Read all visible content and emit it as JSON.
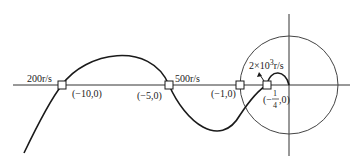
{
  "diagram": {
    "type": "nyquist-plot",
    "frequency_labels": [
      {
        "id": "w1",
        "text": "200r/s"
      },
      {
        "id": "w2",
        "text": "500r/s"
      },
      {
        "id": "w3",
        "text": "2×10",
        "sup": "3",
        "suffix": "r/s"
      }
    ],
    "points": [
      {
        "id": "p1",
        "text": "(−10,0)"
      },
      {
        "id": "p2",
        "text": "(−5,0)"
      },
      {
        "id": "p3",
        "text": "(−1,0)"
      },
      {
        "id": "p4",
        "text_open": "(−",
        "num": "1",
        "den": "4",
        "text_close": ",0)"
      }
    ],
    "colors": {
      "curve": "#1a1a1a",
      "axes": "#333333",
      "circle": "#444444"
    }
  }
}
